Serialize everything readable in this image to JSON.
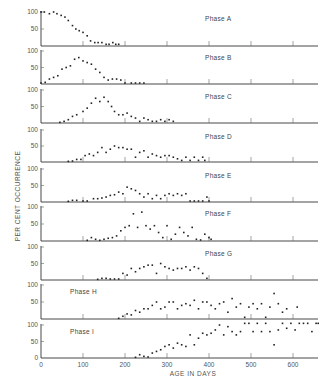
{
  "chart_data": {
    "type": "scatter",
    "title": "",
    "xlabel": "AGE IN DAYS",
    "ylabel": "PER CENT OCCURRENCE",
    "xlim": [
      0,
      660
    ],
    "ylim": [
      0,
      100
    ],
    "x_ticks": [
      0,
      100,
      200,
      300,
      400,
      500,
      600
    ],
    "y_ticks": [
      50,
      100
    ],
    "grid": false,
    "legend": null,
    "panels": [
      {
        "name": "Phase A",
        "label_pos": "right",
        "points": [
          [
            0,
            100
          ],
          [
            8,
            100
          ],
          [
            20,
            95
          ],
          [
            30,
            100
          ],
          [
            38,
            95
          ],
          [
            48,
            90
          ],
          [
            57,
            85
          ],
          [
            65,
            75
          ],
          [
            75,
            60
          ],
          [
            83,
            50
          ],
          [
            91,
            45
          ],
          [
            100,
            40
          ],
          [
            110,
            30
          ],
          [
            118,
            15
          ],
          [
            128,
            10
          ],
          [
            136,
            10
          ],
          [
            145,
            10
          ],
          [
            155,
            5
          ],
          [
            162,
            5
          ],
          [
            171,
            10
          ],
          [
            178,
            5
          ],
          [
            185,
            5
          ]
        ]
      },
      {
        "name": "Phase B",
        "label_pos": "right",
        "points": [
          [
            0,
            3
          ],
          [
            10,
            5
          ],
          [
            20,
            15
          ],
          [
            30,
            20
          ],
          [
            40,
            25
          ],
          [
            50,
            45
          ],
          [
            60,
            50
          ],
          [
            70,
            55
          ],
          [
            80,
            75
          ],
          [
            90,
            80
          ],
          [
            100,
            70
          ],
          [
            110,
            65
          ],
          [
            120,
            60
          ],
          [
            130,
            45
          ],
          [
            140,
            35
          ],
          [
            150,
            20
          ],
          [
            160,
            12
          ],
          [
            170,
            15
          ],
          [
            180,
            15
          ],
          [
            190,
            12
          ],
          [
            200,
            3
          ],
          [
            215,
            3
          ],
          [
            225,
            3
          ],
          [
            235,
            3
          ],
          [
            245,
            3
          ]
        ]
      },
      {
        "name": "Phase C",
        "label_pos": "right",
        "points": [
          [
            45,
            2
          ],
          [
            55,
            5
          ],
          [
            65,
            10
          ],
          [
            75,
            20
          ],
          [
            85,
            25
          ],
          [
            100,
            35
          ],
          [
            110,
            45
          ],
          [
            120,
            60
          ],
          [
            130,
            75
          ],
          [
            140,
            65
          ],
          [
            150,
            78
          ],
          [
            160,
            65
          ],
          [
            168,
            50
          ],
          [
            175,
            35
          ],
          [
            185,
            25
          ],
          [
            195,
            25
          ],
          [
            205,
            30
          ],
          [
            215,
            20
          ],
          [
            225,
            15
          ],
          [
            235,
            5
          ],
          [
            245,
            15
          ],
          [
            255,
            10
          ],
          [
            265,
            5
          ],
          [
            275,
            5
          ],
          [
            285,
            10
          ],
          [
            295,
            5
          ],
          [
            305,
            10
          ],
          [
            315,
            5
          ]
        ]
      },
      {
        "name": "Phase D",
        "label_pos": "right",
        "points": [
          [
            65,
            2
          ],
          [
            75,
            3
          ],
          [
            85,
            8
          ],
          [
            95,
            8
          ],
          [
            105,
            20
          ],
          [
            115,
            25
          ],
          [
            125,
            20
          ],
          [
            135,
            30
          ],
          [
            145,
            45
          ],
          [
            155,
            30
          ],
          [
            165,
            40
          ],
          [
            175,
            50
          ],
          [
            185,
            45
          ],
          [
            195,
            45
          ],
          [
            205,
            40
          ],
          [
            215,
            40
          ],
          [
            225,
            15
          ],
          [
            235,
            30
          ],
          [
            245,
            35
          ],
          [
            255,
            15
          ],
          [
            265,
            25
          ],
          [
            275,
            20
          ],
          [
            285,
            15
          ],
          [
            295,
            20
          ],
          [
            305,
            20
          ],
          [
            315,
            15
          ],
          [
            325,
            10
          ],
          [
            335,
            5
          ],
          [
            345,
            15
          ],
          [
            355,
            5
          ],
          [
            365,
            15
          ],
          [
            375,
            5
          ],
          [
            385,
            15
          ],
          [
            390,
            5
          ]
        ]
      },
      {
        "name": "Phase E",
        "label_pos": "right",
        "points": [
          [
            65,
            2
          ],
          [
            75,
            5
          ],
          [
            85,
            5
          ],
          [
            100,
            3
          ],
          [
            110,
            3
          ],
          [
            125,
            10
          ],
          [
            135,
            10
          ],
          [
            145,
            12
          ],
          [
            155,
            15
          ],
          [
            165,
            20
          ],
          [
            175,
            22
          ],
          [
            185,
            30
          ],
          [
            195,
            25
          ],
          [
            205,
            45
          ],
          [
            215,
            40
          ],
          [
            225,
            35
          ],
          [
            235,
            25
          ],
          [
            245,
            15
          ],
          [
            255,
            25
          ],
          [
            265,
            10
          ],
          [
            275,
            20
          ],
          [
            285,
            10
          ],
          [
            295,
            20
          ],
          [
            305,
            25
          ],
          [
            315,
            20
          ],
          [
            325,
            25
          ],
          [
            335,
            20
          ],
          [
            345,
            25
          ],
          [
            355,
            3
          ],
          [
            365,
            3
          ],
          [
            375,
            3
          ],
          [
            385,
            3
          ],
          [
            395,
            15
          ],
          [
            400,
            3
          ]
        ]
      },
      {
        "name": "Phase F",
        "label_pos": "right",
        "points": [
          [
            110,
            2
          ],
          [
            120,
            10
          ],
          [
            130,
            5
          ],
          [
            140,
            2
          ],
          [
            150,
            5
          ],
          [
            160,
            8
          ],
          [
            170,
            10
          ],
          [
            180,
            15
          ],
          [
            190,
            30
          ],
          [
            200,
            40
          ],
          [
            210,
            45
          ],
          [
            220,
            80
          ],
          [
            230,
            40
          ],
          [
            240,
            85
          ],
          [
            250,
            45
          ],
          [
            260,
            35
          ],
          [
            270,
            45
          ],
          [
            280,
            25
          ],
          [
            290,
            10
          ],
          [
            300,
            45
          ],
          [
            310,
            5
          ],
          [
            320,
            20
          ],
          [
            330,
            40
          ],
          [
            340,
            25
          ],
          [
            350,
            15
          ],
          [
            360,
            40
          ],
          [
            370,
            5
          ],
          [
            380,
            3
          ],
          [
            390,
            20
          ],
          [
            400,
            10
          ],
          [
            405,
            5
          ]
        ]
      },
      {
        "name": "Phase G",
        "label_pos": "right",
        "points": [
          [
            135,
            2
          ],
          [
            145,
            5
          ],
          [
            155,
            5
          ],
          [
            165,
            3
          ],
          [
            175,
            3
          ],
          [
            185,
            3
          ],
          [
            195,
            20
          ],
          [
            205,
            15
          ],
          [
            215,
            35
          ],
          [
            225,
            25
          ],
          [
            235,
            35
          ],
          [
            245,
            40
          ],
          [
            255,
            45
          ],
          [
            265,
            45
          ],
          [
            275,
            20
          ],
          [
            285,
            50
          ],
          [
            295,
            40
          ],
          [
            305,
            35
          ],
          [
            315,
            30
          ],
          [
            325,
            35
          ],
          [
            335,
            35
          ],
          [
            345,
            40
          ],
          [
            355,
            30
          ],
          [
            365,
            40
          ],
          [
            375,
            35
          ],
          [
            385,
            20
          ],
          [
            395,
            5
          ]
        ]
      },
      {
        "name": "Phase H",
        "label_pos": "left",
        "points": [
          [
            185,
            2
          ],
          [
            195,
            8
          ],
          [
            205,
            15
          ],
          [
            215,
            12
          ],
          [
            225,
            25
          ],
          [
            235,
            20
          ],
          [
            245,
            30
          ],
          [
            255,
            30
          ],
          [
            265,
            40
          ],
          [
            275,
            50
          ],
          [
            285,
            30
          ],
          [
            295,
            35
          ],
          [
            305,
            50
          ],
          [
            315,
            50
          ],
          [
            325,
            30
          ],
          [
            335,
            40
          ],
          [
            345,
            45
          ],
          [
            355,
            40
          ],
          [
            365,
            55
          ],
          [
            375,
            30
          ],
          [
            385,
            50
          ],
          [
            395,
            50
          ],
          [
            405,
            40
          ],
          [
            415,
            30
          ],
          [
            425,
            45
          ],
          [
            435,
            50
          ],
          [
            445,
            20
          ],
          [
            455,
            60
          ],
          [
            465,
            35
          ],
          [
            475,
            45
          ],
          [
            485,
            5
          ],
          [
            495,
            35
          ],
          [
            505,
            45
          ],
          [
            515,
            30
          ],
          [
            525,
            45
          ],
          [
            535,
            5
          ],
          [
            545,
            35
          ],
          [
            555,
            75
          ],
          [
            565,
            45
          ],
          [
            575,
            20
          ],
          [
            585,
            30
          ],
          [
            610,
            35
          ]
        ]
      },
      {
        "name": "Phase I",
        "label_pos": "left",
        "points": [
          [
            225,
            2
          ],
          [
            235,
            10
          ],
          [
            245,
            5
          ],
          [
            255,
            3
          ],
          [
            265,
            15
          ],
          [
            275,
            20
          ],
          [
            285,
            25
          ],
          [
            295,
            35
          ],
          [
            305,
            40
          ],
          [
            315,
            30
          ],
          [
            325,
            45
          ],
          [
            335,
            40
          ],
          [
            345,
            35
          ],
          [
            355,
            70
          ],
          [
            365,
            40
          ],
          [
            375,
            60
          ],
          [
            385,
            75
          ],
          [
            395,
            70
          ],
          [
            405,
            75
          ],
          [
            415,
            85
          ],
          [
            425,
            100
          ],
          [
            435,
            70
          ],
          [
            445,
            95
          ],
          [
            455,
            80
          ],
          [
            465,
            70
          ],
          [
            475,
            80
          ],
          [
            485,
            105
          ],
          [
            495,
            105
          ],
          [
            505,
            80
          ],
          [
            515,
            105
          ],
          [
            525,
            80
          ],
          [
            535,
            105
          ],
          [
            545,
            80
          ],
          [
            555,
            40
          ],
          [
            565,
            85
          ],
          [
            575,
            105
          ],
          [
            585,
            90
          ],
          [
            595,
            105
          ],
          [
            605,
            85
          ],
          [
            615,
            105
          ],
          [
            625,
            105
          ],
          [
            635,
            105
          ],
          [
            645,
            80
          ],
          [
            655,
            105
          ],
          [
            660,
            105
          ]
        ]
      }
    ]
  }
}
